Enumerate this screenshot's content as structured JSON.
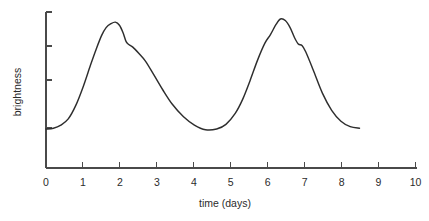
{
  "chart_data": {
    "type": "line",
    "title": "",
    "xlabel": "time (days)",
    "ylabel": "brightness",
    "xlim": [
      0,
      10
    ],
    "ylim": [
      0,
      1
    ],
    "grid": false,
    "legend": "none",
    "x_ticks": [
      "0",
      "1",
      "2",
      "3",
      "4",
      "5",
      "6",
      "7",
      "8",
      "9",
      "10"
    ],
    "x_tick_values": [
      0,
      1,
      2,
      3,
      4,
      5,
      6,
      7,
      8,
      9,
      10
    ],
    "y_ticks": [
      "",
      "",
      "",
      ""
    ],
    "y_tick_values": [
      0.25,
      0.68,
      0.9,
      1.32
    ],
    "y_axis_labeled": false,
    "series": [
      {
        "name": "brightness",
        "color": "#2e2e2e",
        "x": [
          0.0,
          0.2,
          0.4,
          0.6,
          0.8,
          1.0,
          1.2,
          1.35,
          1.5,
          1.62,
          1.75,
          1.87,
          1.98,
          2.08,
          2.16,
          2.24,
          2.34,
          2.5,
          2.68,
          2.9,
          3.15,
          3.4,
          3.7,
          4.0,
          4.3,
          4.6,
          4.85,
          5.1,
          5.3,
          5.5,
          5.7,
          5.9,
          6.05,
          6.2,
          6.32,
          6.45,
          6.58,
          6.7,
          6.8,
          6.9,
          7.0,
          7.2,
          7.45,
          7.7,
          7.95,
          8.2,
          8.45
        ],
        "y": [
          0.25,
          0.255,
          0.275,
          0.315,
          0.4,
          0.52,
          0.66,
          0.76,
          0.85,
          0.9,
          0.925,
          0.935,
          0.915,
          0.865,
          0.81,
          0.79,
          0.775,
          0.735,
          0.685,
          0.6,
          0.5,
          0.41,
          0.33,
          0.275,
          0.245,
          0.25,
          0.28,
          0.35,
          0.44,
          0.56,
          0.69,
          0.8,
          0.855,
          0.92,
          0.955,
          0.945,
          0.9,
          0.835,
          0.795,
          0.785,
          0.745,
          0.63,
          0.48,
          0.37,
          0.3,
          0.265,
          0.255
        ]
      }
    ],
    "annotations": [
      {
        "label": "primary maximum",
        "x": 1.87,
        "y": 0.935
      },
      {
        "label": "secondary shoulder (descent 1)",
        "x": 2.2,
        "y": 0.8
      },
      {
        "label": "minimum",
        "x": 4.3,
        "y": 0.245
      },
      {
        "label": "primary maximum",
        "x": 6.32,
        "y": 0.955
      },
      {
        "label": "secondary shoulder (descent 2)",
        "x": 6.85,
        "y": 0.79
      }
    ],
    "data_end_x": 8.45
  },
  "geometry": {
    "origin_x": 46,
    "origin_y": 168,
    "x_axis_end": 417,
    "y_axis_top": 12,
    "px_per_day": 36.95,
    "y_px_baseline": 128,
    "y_px_top_tick": 12
  }
}
